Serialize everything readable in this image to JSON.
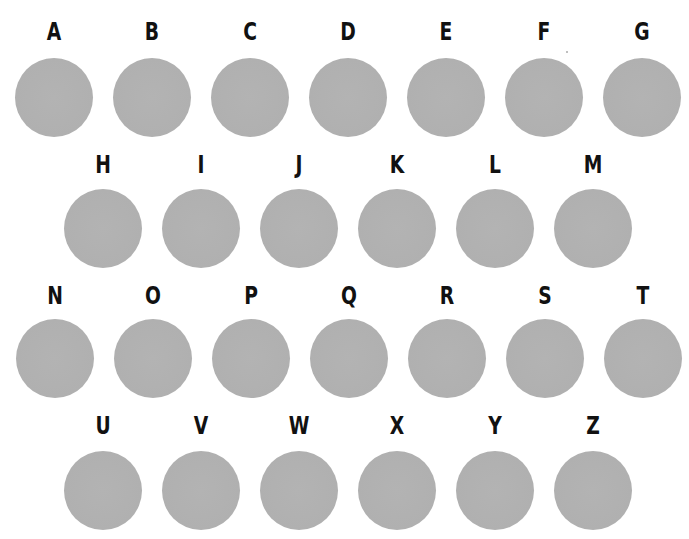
{
  "chart_data": {
    "type": "table",
    "title": "",
    "rows": [
      [
        "A",
        "B",
        "C",
        "D",
        "E",
        "F",
        "G"
      ],
      [
        "H",
        "I",
        "J",
        "K",
        "L",
        "M"
      ],
      [
        "N",
        "O",
        "P",
        "Q",
        "R",
        "S",
        "T"
      ],
      [
        "U",
        "V",
        "W",
        "X",
        "Y",
        "Z"
      ]
    ]
  },
  "colors": {
    "circle": "#b0b0b0",
    "letter": "#111111",
    "background": "#ffffff"
  },
  "rows": [
    {
      "letters": [
        "A",
        "B",
        "C",
        "D",
        "E",
        "F",
        "G"
      ]
    },
    {
      "letters": [
        "H",
        "I",
        "J",
        "K",
        "L",
        "M"
      ]
    },
    {
      "letters": [
        "N",
        "O",
        "P",
        "Q",
        "R",
        "S",
        "T"
      ]
    },
    {
      "letters": [
        "U",
        "V",
        "W",
        "X",
        "Y",
        "Z"
      ]
    }
  ]
}
